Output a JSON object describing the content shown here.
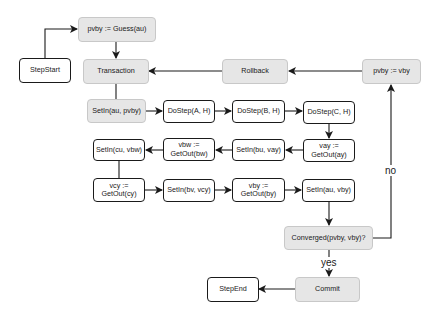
{
  "diagram": {
    "type": "flowchart",
    "nodes": {
      "step_start": {
        "label": "StepStart",
        "style": "plain"
      },
      "guess": {
        "label": "pvby := Guess(au)",
        "style": "shaded"
      },
      "transaction": {
        "label": "Transaction",
        "style": "shaded"
      },
      "rollback": {
        "label": "Rollback",
        "style": "shaded"
      },
      "pvby_vby": {
        "label": "pvby := vby",
        "style": "shaded"
      },
      "setin_au_pvby": {
        "label": "SetIn(au, pvby)",
        "style": "shaded"
      },
      "dostep_a": {
        "label": "DoStep(A, H)",
        "style": "plain"
      },
      "dostep_b": {
        "label": "DoStep(B, H)",
        "style": "plain"
      },
      "dostep_c": {
        "label": "DoStep(C, H)",
        "style": "plain"
      },
      "vay_getout": {
        "label": "vay :=\nGetOut(ay)",
        "style": "plain"
      },
      "setin_bu_vay": {
        "label": "SetIn(bu, vay)",
        "style": "plain"
      },
      "vbw_getout": {
        "label": "vbw :=\nGetOut(bw)",
        "style": "plain"
      },
      "setin_cu_vbw": {
        "label": "SetIn(cu, vbw)",
        "style": "plain"
      },
      "vcy_getout": {
        "label": "vcy :=\nGetOut(cy)",
        "style": "plain"
      },
      "setin_bv_vcy": {
        "label": "SetIn(bv, vcy)",
        "style": "plain"
      },
      "vby_getout": {
        "label": "vby :=\nGetOut(by)",
        "style": "plain"
      },
      "setin_au_vby": {
        "label": "SetIn(au, vby)",
        "style": "plain"
      },
      "converged": {
        "label": "Converged(pvby, vby)?",
        "style": "shaded"
      },
      "commit": {
        "label": "Commit",
        "style": "shaded"
      },
      "step_end": {
        "label": "StepEnd",
        "style": "plain"
      }
    },
    "edges": [
      {
        "from": "step_start",
        "to": "guess"
      },
      {
        "from": "guess",
        "to": "transaction"
      },
      {
        "from": "transaction",
        "to": "setin_au_pvby"
      },
      {
        "from": "setin_au_pvby",
        "to": "dostep_a"
      },
      {
        "from": "dostep_a",
        "to": "dostep_b"
      },
      {
        "from": "dostep_b",
        "to": "dostep_c"
      },
      {
        "from": "dostep_c",
        "to": "vay_getout"
      },
      {
        "from": "vay_getout",
        "to": "setin_bu_vay"
      },
      {
        "from": "setin_bu_vay",
        "to": "vbw_getout"
      },
      {
        "from": "vbw_getout",
        "to": "setin_cu_vbw"
      },
      {
        "from": "setin_cu_vbw",
        "to": "vcy_getout"
      },
      {
        "from": "vcy_getout",
        "to": "setin_bv_vcy"
      },
      {
        "from": "setin_bv_vcy",
        "to": "vby_getout"
      },
      {
        "from": "vby_getout",
        "to": "setin_au_vby"
      },
      {
        "from": "setin_au_vby",
        "to": "converged"
      },
      {
        "from": "converged",
        "to": "commit",
        "label": "yes"
      },
      {
        "from": "converged",
        "to": "pvby_vby",
        "label": "no"
      },
      {
        "from": "pvby_vby",
        "to": "rollback"
      },
      {
        "from": "rollback",
        "to": "transaction"
      },
      {
        "from": "commit",
        "to": "step_end"
      }
    ],
    "edge_labels": {
      "yes": "yes",
      "no": "no"
    },
    "colors": {
      "stroke": "#1a1a1a",
      "shaded_fill": "#e6e6e6",
      "shaded_border": "#c8c8c8",
      "plain_fill": "#ffffff"
    }
  }
}
